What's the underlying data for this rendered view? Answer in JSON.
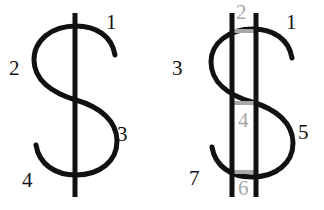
{
  "page": {
    "width": 324,
    "height": 210,
    "background_color": "#ffffff"
  },
  "style": {
    "stroke_color": "#111111",
    "gray_color": "#a8a8a8",
    "stroke_width": 5,
    "gray_stroke_width": 4,
    "label_font_size": 21
  },
  "figures": [
    {
      "id": "figure-left",
      "name": "dollar-sign-single-bar",
      "description": "Dollar sign drawn with one vertical bar through an S curve, four numbered segment labels",
      "label_count": 4,
      "labels": [
        {
          "id": "lbl-l-1",
          "text": "1",
          "color": "#111111",
          "x": 106,
          "y": 12
        },
        {
          "id": "lbl-l-2",
          "text": "2",
          "color": "#111111",
          "x": 9,
          "y": 58
        },
        {
          "id": "lbl-l-3",
          "text": "3",
          "color": "#111111",
          "x": 117,
          "y": 124
        },
        {
          "id": "lbl-l-4",
          "text": "4",
          "color": "#111111",
          "x": 22,
          "y": 170
        }
      ],
      "vertical_bars": [
        {
          "x": 75,
          "y1": 13,
          "y2": 197,
          "color": "#111111"
        }
      ],
      "horizontal_bars": []
    },
    {
      "id": "figure-right",
      "name": "dollar-sign-double-bar",
      "description": "Dollar sign drawn with two vertical bars through an S curve plus three gray horizontal connector bars, seven numbered segment labels",
      "label_count": 7,
      "labels": [
        {
          "id": "lbl-r-1",
          "text": "1",
          "color": "#111111",
          "x": 124,
          "y": 12
        },
        {
          "id": "lbl-r-2",
          "text": "2",
          "color": "#a8a8a8",
          "x": 74,
          "y": 2
        },
        {
          "id": "lbl-r-3",
          "text": "3",
          "color": "#111111",
          "x": 10,
          "y": 58
        },
        {
          "id": "lbl-r-4",
          "text": "4",
          "color": "#a8a8a8",
          "x": 76,
          "y": 110
        },
        {
          "id": "lbl-r-5",
          "text": "5",
          "color": "#111111",
          "x": 136,
          "y": 122
        },
        {
          "id": "lbl-r-6",
          "text": "6",
          "color": "#a8a8a8",
          "x": 76,
          "y": 178
        },
        {
          "id": "lbl-r-7",
          "text": "7",
          "color": "#111111",
          "x": 27,
          "y": 168
        }
      ],
      "vertical_bars": [
        {
          "x": 70,
          "y1": 13,
          "y2": 197,
          "color": "#111111"
        },
        {
          "x": 94,
          "y1": 13,
          "y2": 197,
          "color": "#111111"
        }
      ],
      "horizontal_bars": [
        {
          "y": 31,
          "x1": 70,
          "x2": 94,
          "color": "#a8a8a8"
        },
        {
          "y": 103,
          "x1": 70,
          "x2": 94,
          "color": "#a8a8a8"
        },
        {
          "y": 172,
          "x1": 70,
          "x2": 94,
          "color": "#a8a8a8"
        }
      ]
    }
  ]
}
